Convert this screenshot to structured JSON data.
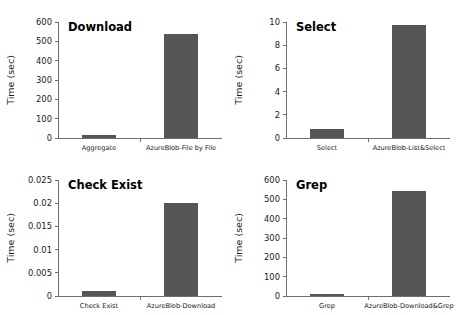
{
  "figure": {
    "name": "azure-blob-benchmark-bar-charts",
    "background": "#ffffff",
    "bar_color": "#555555",
    "axis_color": "#5f5f5f",
    "text_color": "#1a1a1a"
  },
  "chart_data": [
    {
      "type": "bar",
      "title": "Download",
      "xlabel": "",
      "ylabel": "Time (sec)",
      "categories": [
        "Aggregate",
        "AzureBlob-File by File"
      ],
      "values": [
        13,
        540
      ],
      "ylim": [
        0,
        600
      ],
      "yticks": [
        0,
        100,
        200,
        300,
        400,
        500,
        600
      ],
      "ytick_labels": [
        "0",
        "100",
        "200",
        "300",
        "400",
        "500",
        "600"
      ],
      "grid": false,
      "legend": "none"
    },
    {
      "type": "bar",
      "title": "Select",
      "xlabel": "",
      "ylabel": "Time (sec)",
      "categories": [
        "Select",
        "AzureBlob-List&Select"
      ],
      "values": [
        0.8,
        9.75
      ],
      "ylim": [
        0,
        10
      ],
      "yticks": [
        0,
        2,
        4,
        6,
        8,
        10
      ],
      "ytick_labels": [
        "0",
        "2",
        "4",
        "6",
        "8",
        "10"
      ],
      "grid": false,
      "legend": "none"
    },
    {
      "type": "bar",
      "title": "Check Exist",
      "xlabel": "",
      "ylabel": "Time (sec)",
      "categories": [
        "Check Exist",
        "AzureBlob-Download"
      ],
      "values": [
        0.001,
        0.0201
      ],
      "ylim": [
        0,
        0.025
      ],
      "yticks": [
        0,
        0.005,
        0.01,
        0.015,
        0.02,
        0.025
      ],
      "ytick_labels": [
        "0",
        "0.005",
        "0.01",
        "0.015",
        "0.02",
        "0.025"
      ],
      "grid": false,
      "legend": "none"
    },
    {
      "type": "bar",
      "title": "Grep",
      "xlabel": "",
      "ylabel": "Time (sec)",
      "categories": [
        "Grep",
        "AzureBlob-Download&Grep"
      ],
      "values": [
        9,
        543
      ],
      "ylim": [
        0,
        600
      ],
      "yticks": [
        0,
        100,
        200,
        300,
        400,
        500,
        600
      ],
      "ytick_labels": [
        "0",
        "100",
        "200",
        "300",
        "400",
        "500",
        "600"
      ],
      "grid": false,
      "legend": "none"
    }
  ]
}
